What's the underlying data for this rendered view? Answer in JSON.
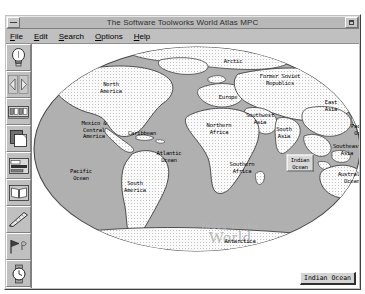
{
  "window": {
    "title": "The Software Toolworks World Atlas MPC",
    "sysmenu_icon": "system-menu-icon",
    "maximize_icon": "maximize-icon"
  },
  "menubar": {
    "items": [
      {
        "label": "File",
        "accel": "F",
        "rest": "ile"
      },
      {
        "label": "Edit",
        "accel": "E",
        "rest": "dit"
      },
      {
        "label": "Search",
        "accel": "S",
        "rest": "earch"
      },
      {
        "label": "Options",
        "accel": "O",
        "rest": "ptions"
      },
      {
        "label": "Help",
        "accel": "H",
        "rest": "elp"
      }
    ]
  },
  "toolbar": {
    "buttons": [
      {
        "name": "lightbulb-icon",
        "tip": "Topics"
      },
      {
        "name": "arrows-icon",
        "tip": "Back / Forward"
      },
      {
        "name": "filmstrip-icon",
        "tip": "Pictures"
      },
      {
        "name": "pages-icon",
        "tip": "Documents"
      },
      {
        "name": "chart-icon",
        "tip": "Statistics"
      },
      {
        "name": "book-icon",
        "tip": "Encyclopedia"
      },
      {
        "name": "ruler-icon",
        "tip": "Measure"
      },
      {
        "name": "flag-icon",
        "tip": "Flags"
      },
      {
        "name": "watch-icon",
        "tip": "Time"
      },
      {
        "name": "compass-icon",
        "tip": "Navigate"
      }
    ]
  },
  "map": {
    "watermark_line1": "Index to the",
    "watermark_line2": "World",
    "selected_region": "Indian\nOcean",
    "ocean_color": "#b0b0b0",
    "land_color": "#f2f2f2",
    "labels": [
      {
        "text": "Arctic",
        "x": 201,
        "y": 17
      },
      {
        "text": "North\nAmerica",
        "x": 79,
        "y": 43
      },
      {
        "text": "Former Soviet\nRepublics",
        "x": 248,
        "y": 35
      },
      {
        "text": "Europe",
        "x": 196,
        "y": 53
      },
      {
        "text": "East\nAsia",
        "x": 299,
        "y": 61
      },
      {
        "text": "Southwest\nAsia",
        "x": 228,
        "y": 74
      },
      {
        "text": "Mexico &\nCentral\nAmerica",
        "x": 62,
        "y": 86
      },
      {
        "text": "Caribbean",
        "x": 110,
        "y": 89
      },
      {
        "text": "Northern\nAfrica",
        "x": 187,
        "y": 84
      },
      {
        "text": "South\nAsia",
        "x": 252,
        "y": 88
      },
      {
        "text": "Pacific\nOcean",
        "x": 330,
        "y": 85
      },
      {
        "text": "Southeast\nAsia",
        "x": 315,
        "y": 105
      },
      {
        "text": "Atlantic\nOcean",
        "x": 137,
        "y": 112
      },
      {
        "text": "Pacific\nOcean",
        "x": 49,
        "y": 130
      },
      {
        "text": "Southern\nAfrica",
        "x": 210,
        "y": 123
      },
      {
        "text": "Australia &\nOceania",
        "x": 323,
        "y": 133
      },
      {
        "text": "South\nAmerica",
        "x": 103,
        "y": 142
      },
      {
        "text": "Antarctica",
        "x": 208,
        "y": 197
      }
    ],
    "selected_label_pos": {
      "x": 268,
      "y": 119
    }
  },
  "status": {
    "label": "Indian Ocean"
  }
}
